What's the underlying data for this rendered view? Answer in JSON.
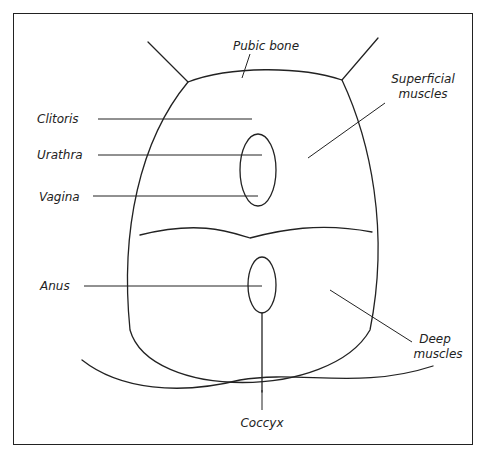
{
  "figure": {
    "type": "anatomical line drawing",
    "colors": {
      "ink": "#222222",
      "background": "#ffffff"
    },
    "labels": {
      "pubic_bone": "Pubic bone",
      "superficial_1": "Superficial",
      "superficial_2": "muscles",
      "clitoris": "Clitoris",
      "urethra": "Urathra",
      "vagina": "Vagina",
      "anus": "Anus",
      "deep_1": "Deep",
      "deep_2": "muscles",
      "coccyx": "Coccyx"
    }
  }
}
